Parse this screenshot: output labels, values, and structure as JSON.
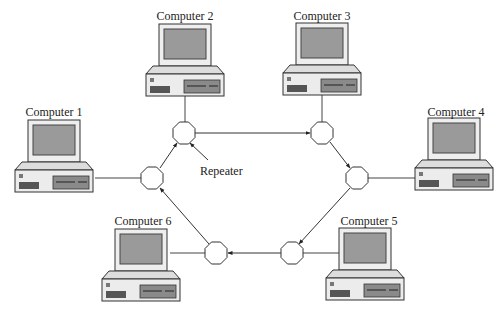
{
  "diagram": {
    "type": "ring-network",
    "colors": {
      "line": "#333333",
      "monitor_bezel": "#eeeeee",
      "screen": "#9a9a9a",
      "base": "#ececec",
      "drive_bay": "#8a8a8a",
      "repeater_fill": "#ffffff"
    },
    "computers": [
      {
        "id": "computer-1",
        "label": "Computer 1"
      },
      {
        "id": "computer-2",
        "label": "Computer 2"
      },
      {
        "id": "computer-3",
        "label": "Computer 3"
      },
      {
        "id": "computer-4",
        "label": "Computer 4"
      },
      {
        "id": "computer-5",
        "label": "Computer 5"
      },
      {
        "id": "computer-6",
        "label": "Computer 6"
      }
    ],
    "repeater_label": "Repeater",
    "ring_direction": "clockwise",
    "edges": [
      {
        "from": "repeater-2",
        "to": "repeater-3"
      },
      {
        "from": "repeater-3",
        "to": "repeater-4"
      },
      {
        "from": "repeater-4",
        "to": "repeater-5"
      },
      {
        "from": "repeater-5",
        "to": "repeater-6"
      },
      {
        "from": "repeater-6",
        "to": "repeater-1"
      },
      {
        "from": "repeater-1",
        "to": "repeater-2"
      }
    ]
  }
}
